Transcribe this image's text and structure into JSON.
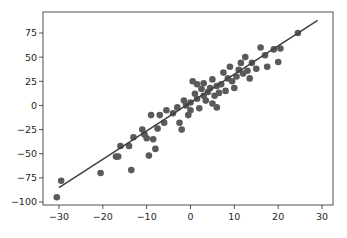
{
  "chart_data": {
    "type": "scatter",
    "title": "",
    "xlabel": "",
    "ylabel": "",
    "xlim": [
      -32.5,
      32
    ],
    "ylim": [
      -103,
      96
    ],
    "grid": false,
    "legend": null,
    "x_ticks": [
      -30,
      -20,
      -10,
      0,
      10,
      20,
      30
    ],
    "y_ticks": [
      -100,
      -75,
      -50,
      -25,
      0,
      25,
      50,
      75
    ],
    "colors": {
      "points": "#5a5a5a",
      "line": "#3f3f3f",
      "axes": "#262626"
    },
    "fit_line": {
      "x": [
        -30,
        29
      ],
      "y": [
        -85,
        88
      ]
    },
    "points": [
      {
        "x": -30.5,
        "y": -95
      },
      {
        "x": -29.5,
        "y": -78
      },
      {
        "x": -20.5,
        "y": -70
      },
      {
        "x": -17,
        "y": -53
      },
      {
        "x": -16.5,
        "y": -53
      },
      {
        "x": -16,
        "y": -42
      },
      {
        "x": -14,
        "y": -42
      },
      {
        "x": -13.5,
        "y": -67
      },
      {
        "x": -13,
        "y": -33
      },
      {
        "x": -11,
        "y": -25
      },
      {
        "x": -10.5,
        "y": -30
      },
      {
        "x": -10,
        "y": -34
      },
      {
        "x": -9.5,
        "y": -52
      },
      {
        "x": -9,
        "y": -10
      },
      {
        "x": -8.5,
        "y": -35
      },
      {
        "x": -8,
        "y": -45
      },
      {
        "x": -7.5,
        "y": -24
      },
      {
        "x": -7,
        "y": -10
      },
      {
        "x": -6,
        "y": -18
      },
      {
        "x": -5.5,
        "y": -5
      },
      {
        "x": -4,
        "y": -8
      },
      {
        "x": -3,
        "y": -2
      },
      {
        "x": -2.5,
        "y": -18
      },
      {
        "x": -2,
        "y": -25
      },
      {
        "x": -1.5,
        "y": 5
      },
      {
        "x": -1,
        "y": 0
      },
      {
        "x": -0.5,
        "y": -10
      },
      {
        "x": 0,
        "y": 3
      },
      {
        "x": 0,
        "y": -5
      },
      {
        "x": 0.5,
        "y": 25
      },
      {
        "x": 1,
        "y": 12
      },
      {
        "x": 1.5,
        "y": 7
      },
      {
        "x": 1.5,
        "y": 22
      },
      {
        "x": 2,
        "y": -3
      },
      {
        "x": 2.5,
        "y": 17
      },
      {
        "x": 3,
        "y": 10
      },
      {
        "x": 3,
        "y": 23
      },
      {
        "x": 3.5,
        "y": 5
      },
      {
        "x": 4,
        "y": 14
      },
      {
        "x": 4.5,
        "y": 18
      },
      {
        "x": 5,
        "y": 27
      },
      {
        "x": 5,
        "y": 2
      },
      {
        "x": 5.5,
        "y": 10
      },
      {
        "x": 6,
        "y": 20
      },
      {
        "x": 6,
        "y": -2
      },
      {
        "x": 6.5,
        "y": 13
      },
      {
        "x": 7,
        "y": 22
      },
      {
        "x": 7.5,
        "y": 34
      },
      {
        "x": 8,
        "y": 15
      },
      {
        "x": 8.5,
        "y": 28
      },
      {
        "x": 9,
        "y": 40
      },
      {
        "x": 9.5,
        "y": 25
      },
      {
        "x": 10,
        "y": 18
      },
      {
        "x": 10.5,
        "y": 30
      },
      {
        "x": 11,
        "y": 37
      },
      {
        "x": 11.5,
        "y": 44
      },
      {
        "x": 12,
        "y": 33
      },
      {
        "x": 12.5,
        "y": 50
      },
      {
        "x": 13,
        "y": 36
      },
      {
        "x": 13.5,
        "y": 28
      },
      {
        "x": 14,
        "y": 44
      },
      {
        "x": 15,
        "y": 38
      },
      {
        "x": 16,
        "y": 60
      },
      {
        "x": 17,
        "y": 52
      },
      {
        "x": 17.5,
        "y": 40
      },
      {
        "x": 19,
        "y": 58
      },
      {
        "x": 20,
        "y": 45
      },
      {
        "x": 20.5,
        "y": 59
      },
      {
        "x": 24.5,
        "y": 75
      }
    ]
  }
}
